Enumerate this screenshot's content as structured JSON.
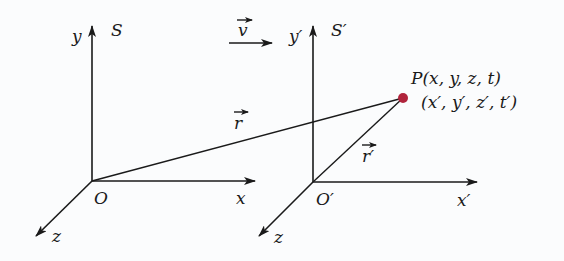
{
  "diagram": {
    "type": "reference-frames",
    "colors": {
      "lines": "#1a1a1a",
      "point": "#b0243c",
      "background": "#fbfcfd"
    },
    "frame_s": {
      "name": "S",
      "origin_label": "O",
      "x_label": "x",
      "y_label": "y",
      "z_label": "z"
    },
    "frame_s_prime": {
      "name": "S′",
      "origin_label": "O′",
      "x_label": "x′",
      "y_label": "y′",
      "z_label": "z"
    },
    "velocity": {
      "label": "v"
    },
    "position_vectors": {
      "r_label": "r",
      "r_prime_label": "r′"
    },
    "point": {
      "label_s": "P(x, y, z, t)",
      "label_s_prime": "(x′, y′, z′, t′)"
    }
  }
}
